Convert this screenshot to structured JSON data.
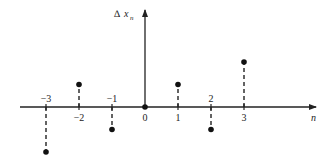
{
  "chart_data": {
    "type": "stem",
    "title": "",
    "xlabel": "n",
    "ylabel": "x_n",
    "ylabel_prefix_symbol": "delta-triangle",
    "x": [
      -3,
      -2,
      -1,
      0,
      1,
      2,
      3
    ],
    "values": [
      -2,
      1,
      -1,
      0,
      1,
      -1,
      2
    ],
    "tick_labels": [
      "−3",
      "−2",
      "−1",
      "0",
      "1",
      "2",
      "3"
    ],
    "tick_label_side": [
      "above",
      "below",
      "above",
      "below",
      "below",
      "above",
      "below"
    ],
    "stem_style": "dashed",
    "marker": "filled-circle",
    "grid": false,
    "legend": null,
    "xlim": [
      -4,
      5
    ],
    "ylim": [
      -2.2,
      4.3
    ]
  },
  "labels": {
    "x_axis": "n",
    "y_axis": "x",
    "y_axis_sub": "n",
    "y_axis_symbol": "∆"
  },
  "colors": {
    "ink": "#222222",
    "background": "#ffffff"
  }
}
